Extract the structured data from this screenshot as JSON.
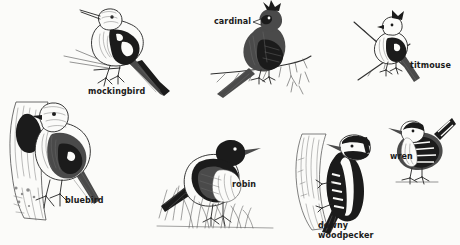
{
  "plate": {
    "title": "Backyard Birds Illustration Plate",
    "background_color": "#fbfbf9",
    "ink_color": "#1b1b1b",
    "caption_color": "#1a1a1a",
    "width": 460,
    "height": 245,
    "style": "pen-and-ink stipple field-guide engraving"
  },
  "birds": [
    {
      "id": "mockingbird",
      "label": "mockingbird",
      "caption_x": 88,
      "caption_y": 87,
      "description": "slender long-tailed songbird perched on a thin twig, head up and to the left, dark wings with white wing patch, long dark tail angled down-right"
    },
    {
      "id": "cardinal",
      "label": "cardinal",
      "caption_x": 214,
      "caption_y": 17,
      "description": "crested cardinal facing right perched on a budding branch, stout conical bill, long tail sweeping down to the left"
    },
    {
      "id": "titmouse",
      "label": "titmouse",
      "caption_x": 410,
      "caption_y": 61,
      "description": "small crested tufted titmouse gripping a crossed twig, body angled down-right, short bill"
    },
    {
      "id": "bluebird",
      "label": "bluebird",
      "caption_x": 65,
      "caption_y": 196,
      "description": "bluebird perched at the dark entrance hole of a tree-trunk nest cavity, rounded head, tail pointing down-right"
    },
    {
      "id": "robin",
      "label": "robin",
      "caption_x": 232,
      "caption_y": 180,
      "description": "american robin standing in tufted grass, dark head and back, pale breast, facing right"
    },
    {
      "id": "downy-woodpecker",
      "label": "downy\nwoodpecker",
      "caption_x": 318,
      "caption_y": 221,
      "description": "downy woodpecker clinging vertically to a bark-covered trunk, black-and-white barred wings, head turned right, stiff tail braced below"
    },
    {
      "id": "wren",
      "label": "wren",
      "caption_x": 390,
      "caption_y": 152,
      "description": "house wren with cocked tail standing on a short perch, heavily barred wings and tail, thin pointed bill"
    }
  ]
}
